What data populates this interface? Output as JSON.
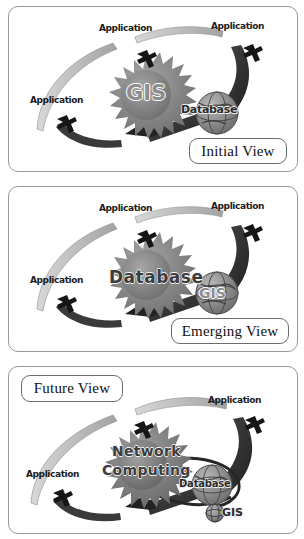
{
  "figure": {
    "panel_count": 3
  },
  "colors": {
    "panel_border": "#9a9a9a",
    "caption_border": "#6b6b6b",
    "dark_arrow": "#2e2e2e",
    "light_arrow": "#b5b5b5",
    "starburst": "#8a8a8a",
    "globe": "#8e8e8e",
    "background": "#ffffff",
    "text": "#1b1b1b"
  },
  "panels": [
    {
      "id": "initial-view",
      "caption": "Initial View",
      "nodes": [
        {
          "role": "application",
          "label": "Application",
          "position": "top-left"
        },
        {
          "role": "application",
          "label": "Application",
          "position": "top-right"
        },
        {
          "role": "application",
          "label": "Application",
          "position": "left"
        },
        {
          "role": "core-starburst",
          "label": "GIS",
          "position": "center"
        },
        {
          "role": "globe",
          "label": "Database",
          "position": "center-right"
        }
      ],
      "arrows": [
        {
          "style": "light",
          "from": "left",
          "to": "top-left"
        },
        {
          "style": "light",
          "from": "top-left",
          "to": "top-right"
        },
        {
          "style": "dark",
          "from": "top-right",
          "to": "globe"
        },
        {
          "style": "dark",
          "from": "globe",
          "to": "left",
          "arrowhead": true
        }
      ]
    },
    {
      "id": "emerging-view",
      "caption": "Emerging View",
      "nodes": [
        {
          "role": "application",
          "label": "Application",
          "position": "top-left"
        },
        {
          "role": "application",
          "label": "Application",
          "position": "top-right"
        },
        {
          "role": "application",
          "label": "Application",
          "position": "left"
        },
        {
          "role": "core-starburst",
          "label": "Database",
          "position": "center"
        },
        {
          "role": "globe",
          "label": "GIS",
          "position": "center-right"
        }
      ],
      "arrows": [
        {
          "style": "light",
          "from": "left",
          "to": "top-left"
        },
        {
          "style": "light",
          "from": "top-left",
          "to": "top-right"
        },
        {
          "style": "dark",
          "from": "top-right",
          "to": "globe"
        },
        {
          "style": "dark",
          "from": "globe",
          "to": "left",
          "arrowhead": true
        }
      ]
    },
    {
      "id": "future-view",
      "caption": "Future View",
      "nodes": [
        {
          "role": "application",
          "label": "Application",
          "position": "top-left"
        },
        {
          "role": "application",
          "label": "Application",
          "position": "top-right"
        },
        {
          "role": "application",
          "label": "Application",
          "position": "left"
        },
        {
          "role": "core-starburst",
          "label_line1": "Network",
          "label_line2": "Computing",
          "position": "center"
        },
        {
          "role": "globe",
          "label": "Database",
          "position": "center-right"
        },
        {
          "role": "globe-small",
          "label": "GIS",
          "position": "bottom-right"
        }
      ],
      "arrows": [
        {
          "style": "light",
          "from": "left",
          "to": "top-left"
        },
        {
          "style": "light",
          "from": "top-left",
          "to": "top-right"
        },
        {
          "style": "dark",
          "from": "top-right",
          "to": "globe"
        },
        {
          "style": "dark",
          "from": "globe",
          "to": "left",
          "arrowhead": true
        },
        {
          "style": "dark-thin",
          "from": "core",
          "to": "gis-small",
          "loop": true
        }
      ]
    }
  ]
}
